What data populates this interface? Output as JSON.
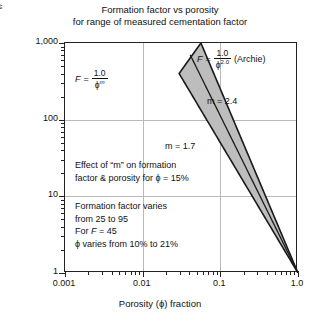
{
  "title": {
    "line1": "Formation factor vs porosity",
    "line2": "for range of measured cementation factor"
  },
  "axes": {
    "y_title_main": "Formation factor (F)",
    "y_title_frac_num": "R",
    "y_title_frac_num_sub": "O",
    "y_title_frac_den": "R",
    "y_title_frac_den_sub": "W",
    "x_title": "Porosity (ϕ) fraction",
    "y_ticks": [
      "1,000",
      "100",
      "10",
      "1"
    ],
    "y_tick_values": [
      1000,
      100,
      10,
      1
    ],
    "x_ticks": [
      "0.001",
      "0.01",
      "0.1",
      "1.0"
    ],
    "x_tick_values": [
      0.001,
      0.01,
      0.1,
      1.0
    ]
  },
  "annotations": {
    "formula_left": {
      "lhs": "F",
      "eq": "=",
      "numerator": "1.0",
      "denominator_base": "ϕ",
      "denominator_exp": "m"
    },
    "formula_archie": {
      "lhs": "F",
      "eq": "=",
      "numerator": "1.0",
      "denominator_base": "ϕ",
      "denominator_exp": "2.0",
      "suffix": "(Archie)"
    },
    "m_high": "m = 2.4",
    "m_low": "m = 1.7",
    "block_effect": [
      "Effect of “m” on formation",
      "factor & porosity for ϕ = 15%"
    ],
    "block_range": [
      "Formation factor varies",
      "from 25 to 95",
      "For F = 45",
      "ϕ varies from 10% to 21%"
    ]
  },
  "chart_data": {
    "type": "line",
    "title": "Formation factor vs porosity for range of measured cementation factor",
    "xlabel": "Porosity (ϕ) fraction",
    "ylabel": "Formation factor (F) = R_O / R_W",
    "xscale": "log",
    "yscale": "log",
    "xlim": [
      0.001,
      1.0
    ],
    "ylim": [
      1,
      1000
    ],
    "grid": true,
    "legend_position": "none",
    "series": [
      {
        "name": "m = 1.7",
        "equation": "F = 1.0 / ϕ^1.7",
        "m": 1.7,
        "x": [
          1.0,
          0.5,
          0.3,
          0.21,
          0.15,
          0.1,
          0.05,
          0.0295
        ],
        "y": [
          1.0,
          3.25,
          7.4,
          14.0,
          25.0,
          50.1,
          163.0,
          400.0
        ]
      },
      {
        "name": "m = 2.4",
        "equation": "F = 1.0 / ϕ^2.4",
        "m": 2.4,
        "x": [
          1.0,
          0.5,
          0.3,
          0.21,
          0.15,
          0.1,
          0.07,
          0.0513
        ],
        "y": [
          1.0,
          5.28,
          15.1,
          35.5,
          95.0,
          251.0,
          589.0,
          1000.0
        ]
      }
    ],
    "shaded_band": {
      "label": "range of measured cementation factor",
      "between": [
        "m = 1.7",
        "m = 2.4"
      ],
      "fill": "#bdbdbd"
    },
    "reference_points": [
      {
        "phi": 0.15,
        "F_min": 25,
        "F_max": 95,
        "note": "Formation factor varies from 25 to 95 at ϕ = 15%"
      },
      {
        "F": 45,
        "phi_min": 0.1,
        "phi_max": 0.21,
        "note": "For F = 45, ϕ varies from 10% to 21%"
      }
    ]
  },
  "colors": {
    "band_fill": "#bdbdbd",
    "curve": "#1a1a1a",
    "grid": "#b9b9b9",
    "axis": "#222222",
    "text": "#111111",
    "background": "#ffffff"
  }
}
